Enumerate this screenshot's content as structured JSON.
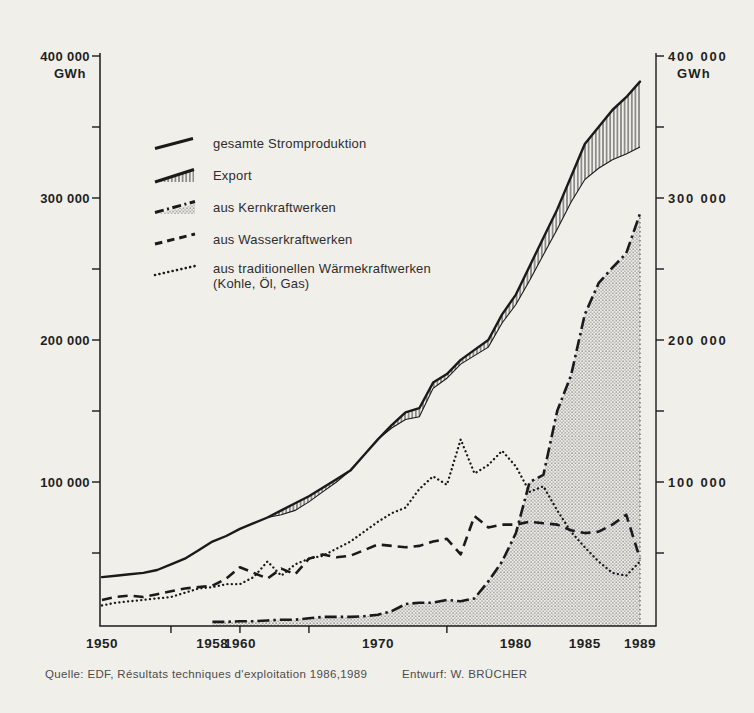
{
  "figure": {
    "paper_color": "#f1efea",
    "ink_color": "#1a1a1a",
    "stipple_color": "#7a7a7a"
  },
  "footer": {
    "source": "Quelle: EDF, Résultats techniques d'exploitation 1986,1989",
    "credit": "Entwurf: W. BRÜCHER"
  },
  "chart_data": {
    "type": "line",
    "title": "",
    "xlabel": "",
    "ylabel": "GWh",
    "x_range": [
      1950,
      1989
    ],
    "y_range": [
      0,
      400000
    ],
    "grid": false,
    "legend_position": "upper-left-inside",
    "y_axis": {
      "unit": "GWh",
      "ticks": [
        {
          "value": 50000,
          "label": ""
        },
        {
          "value": 100000,
          "label": "100 000"
        },
        {
          "value": 150000,
          "label": ""
        },
        {
          "value": 200000,
          "label": "200 000"
        },
        {
          "value": 250000,
          "label": ""
        },
        {
          "value": 300000,
          "label": "300 000"
        },
        {
          "value": 350000,
          "label": ""
        },
        {
          "value": 400000,
          "label": "400 000"
        }
      ]
    },
    "x_axis": {
      "ticks": [
        {
          "year": 1950,
          "label": "1950",
          "mark": false
        },
        {
          "year": 1955,
          "label": "",
          "mark": true
        },
        {
          "year": 1958,
          "label": "1958",
          "mark": false
        },
        {
          "year": 1960,
          "label": "1960",
          "mark": true
        },
        {
          "year": 1965,
          "label": "",
          "mark": true
        },
        {
          "year": 1970,
          "label": "1970",
          "mark": false
        },
        {
          "year": 1975,
          "label": "",
          "mark": true
        },
        {
          "year": 1980,
          "label": "1980",
          "mark": false
        },
        {
          "year": 1985,
          "label": "1985",
          "mark": false
        },
        {
          "year": 1989,
          "label": "1989",
          "mark": false
        }
      ]
    },
    "years": [
      1950,
      1951,
      1952,
      1953,
      1954,
      1955,
      1956,
      1957,
      1958,
      1959,
      1960,
      1961,
      1962,
      1963,
      1964,
      1965,
      1966,
      1967,
      1968,
      1969,
      1970,
      1971,
      1972,
      1973,
      1974,
      1975,
      1976,
      1977,
      1978,
      1979,
      1980,
      1981,
      1982,
      1983,
      1984,
      1985,
      1986,
      1987,
      1988,
      1989
    ],
    "series": [
      {
        "key": "total",
        "name": "gesamte Stromproduktion",
        "style": "solid-line",
        "values": [
          33000,
          34000,
          35000,
          36000,
          38000,
          42000,
          46000,
          52000,
          58000,
          62000,
          67000,
          71000,
          75000,
          80000,
          85000,
          90000,
          96000,
          102000,
          108000,
          119000,
          130000,
          140000,
          149000,
          152000,
          170000,
          176000,
          186000,
          193000,
          200000,
          218000,
          232000,
          252000,
          272000,
          292000,
          315000,
          338000,
          350000,
          362000,
          371000,
          382000
        ]
      },
      {
        "key": "export",
        "name": "Export",
        "style": "hatched-band-below-total",
        "values": [
          0,
          0,
          0,
          0,
          0,
          0,
          0,
          0,
          0,
          0,
          0,
          0,
          0,
          3000,
          5000,
          4000,
          3000,
          2000,
          0,
          0,
          0,
          2000,
          5000,
          6000,
          4000,
          3000,
          3000,
          4000,
          5000,
          6000,
          7000,
          10000,
          12000,
          14000,
          18000,
          25000,
          29000,
          35000,
          40000,
          46000
        ]
      },
      {
        "key": "nuclear",
        "name": "aus Kernkraftwerken",
        "style": "dashdot-line-stippled-area",
        "values": [
          null,
          null,
          null,
          null,
          null,
          null,
          null,
          null,
          1500,
          1500,
          2000,
          2000,
          2500,
          3000,
          3000,
          4000,
          5000,
          5000,
          5000,
          5500,
          6500,
          9000,
          14000,
          15000,
          15000,
          17000,
          16000,
          18000,
          30000,
          44000,
          64000,
          100000,
          105000,
          150000,
          175000,
          218000,
          240000,
          251000,
          261000,
          289000
        ]
      },
      {
        "key": "hydro",
        "name": "aus Wasserkraftwerken",
        "style": "dashed-line",
        "values": [
          17000,
          19000,
          20000,
          19000,
          21000,
          23000,
          25000,
          26000,
          27000,
          32000,
          40000,
          36000,
          32000,
          39000,
          35000,
          46000,
          49000,
          47000,
          48000,
          52000,
          56000,
          55000,
          54000,
          55000,
          58000,
          60000,
          49000,
          76000,
          68000,
          70000,
          70000,
          72000,
          71000,
          70000,
          66000,
          64000,
          65000,
          70000,
          77000,
          46000
        ]
      },
      {
        "key": "thermal",
        "name": "aus traditionellen Wärmekraftwerken (Kohle, Öl, Gas)",
        "style": "dotted-line",
        "values": [
          13000,
          15000,
          16000,
          17000,
          18000,
          19000,
          22000,
          25000,
          26000,
          28000,
          28000,
          33000,
          44000,
          34000,
          42000,
          46000,
          48000,
          53000,
          58000,
          65000,
          72000,
          78000,
          82000,
          95000,
          104000,
          98000,
          130000,
          106000,
          112000,
          122000,
          111000,
          93000,
          97000,
          80000,
          65000,
          54000,
          44000,
          36000,
          34000,
          44000
        ]
      }
    ],
    "legend": [
      {
        "label": "gesamte Stromproduktion"
      },
      {
        "label": "Export"
      },
      {
        "label": "aus Kernkraftwerken"
      },
      {
        "label": "aus Wasserkraftwerken"
      },
      {
        "label": "aus traditionellen Wärmekraftwerken",
        "sublabel": "(Kohle, Öl, Gas)"
      }
    ]
  }
}
